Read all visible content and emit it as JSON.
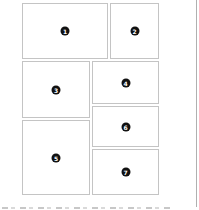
{
  "layout": {
    "panels": [
      {
        "id": "1",
        "label": "1"
      },
      {
        "id": "2",
        "label": "2"
      },
      {
        "id": "3",
        "label": "3"
      },
      {
        "id": "4",
        "label": "4"
      },
      {
        "id": "5",
        "label": "5"
      },
      {
        "id": "6",
        "label": "6"
      },
      {
        "id": "7",
        "label": "7"
      }
    ]
  },
  "colors": {
    "panel_border": "#c4c4c4",
    "badge_fill": "#111111",
    "badge_text": "#ffffff",
    "rule": "#b0b0b0"
  }
}
